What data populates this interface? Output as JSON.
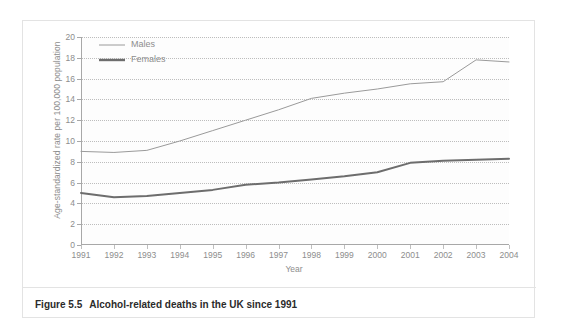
{
  "figure": {
    "caption_number": "Figure 5.5",
    "caption_text": "Alcohol-related deaths in the UK since 1991"
  },
  "colors": {
    "males_line": "#9a9a9a",
    "females_line": "#6d6d6d",
    "gridline": "#bdbdbd",
    "axis": "#a8a8a8",
    "tick_text": "#8d8d8d",
    "caption_text": "#2b2b2b",
    "card_border": "#e3e3e3",
    "plot_background": "#fdfdfd"
  },
  "chart_data": {
    "type": "line",
    "title": "",
    "xlabel": "Year",
    "ylabel": "Age-standardized rate per 100,000 population",
    "categories": [
      "1991",
      "1992",
      "1993",
      "1994",
      "1995",
      "1996",
      "1997",
      "1998",
      "1999",
      "2000",
      "2001",
      "2002",
      "2003",
      "2004"
    ],
    "x": [
      1991,
      1992,
      1993,
      1994,
      1995,
      1996,
      1997,
      1998,
      1999,
      2000,
      2001,
      2002,
      2003,
      2004
    ],
    "xlim": [
      1991,
      2004
    ],
    "ylim": [
      0,
      20
    ],
    "yticks": [
      0,
      2,
      4,
      6,
      8,
      10,
      12,
      14,
      16,
      18,
      20
    ],
    "ytick_labels": [
      "0",
      "2",
      "4",
      "6",
      "8",
      "10",
      "12",
      "14",
      "16",
      "18",
      "20"
    ],
    "grid": true,
    "grid_orientation": "horizontal",
    "legend_position": "top-left",
    "series": [
      {
        "name": "Males",
        "values": [
          9.0,
          8.9,
          9.1,
          10.0,
          11.0,
          12.0,
          13.0,
          14.1,
          14.6,
          15.0,
          15.5,
          15.7,
          17.8,
          17.6
        ],
        "line_width": 1,
        "color": "#9a9a9a"
      },
      {
        "name": "Females",
        "values": [
          5.0,
          4.6,
          4.7,
          5.0,
          5.3,
          5.8,
          6.0,
          6.3,
          6.6,
          7.0,
          7.9,
          8.1,
          8.2,
          8.3
        ],
        "line_width": 2,
        "color": "#6d6d6d"
      }
    ]
  }
}
